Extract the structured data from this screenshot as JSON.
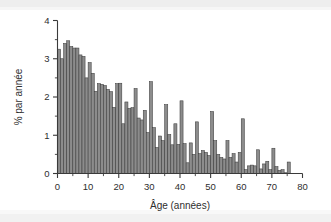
{
  "chart_data": {
    "type": "bar",
    "title": "",
    "subtitle": "",
    "xlabel": "Âge (années)",
    "ylabel": "% par année",
    "xlim": [
      0,
      80
    ],
    "ylim": [
      0,
      4
    ],
    "grid": false,
    "legend": null,
    "bin_width": 1,
    "x_ticks_major": [
      0,
      10,
      20,
      30,
      40,
      50,
      60,
      70,
      80
    ],
    "x_ticks_major_labels": [
      "0",
      "10",
      "20",
      "30",
      "40",
      "50",
      "60",
      "70",
      "80"
    ],
    "x_ticks_minor": [
      5,
      15,
      25,
      35,
      45,
      55,
      65,
      75
    ],
    "y_ticks_major": [
      0,
      1,
      2,
      3,
      4
    ],
    "y_ticks_major_labels": [
      "0",
      "1",
      "2",
      "3",
      "4"
    ],
    "y_ticks_minor": [
      0.5,
      1.5,
      2.5,
      3.5
    ],
    "categories": [
      0,
      1,
      2,
      3,
      4,
      5,
      6,
      7,
      8,
      9,
      10,
      11,
      12,
      13,
      14,
      15,
      16,
      17,
      18,
      19,
      20,
      21,
      22,
      23,
      24,
      25,
      26,
      27,
      28,
      29,
      30,
      31,
      32,
      33,
      34,
      35,
      36,
      37,
      38,
      39,
      40,
      41,
      42,
      43,
      44,
      45,
      46,
      47,
      48,
      49,
      50,
      51,
      52,
      53,
      54,
      55,
      56,
      57,
      58,
      59,
      60,
      61,
      62,
      63,
      64,
      65,
      66,
      67,
      68,
      69,
      70,
      71,
      72,
      73,
      74,
      75
    ],
    "values": [
      3.25,
      3.0,
      3.4,
      3.47,
      3.32,
      3.28,
      3.28,
      3.1,
      3.06,
      2.5,
      2.9,
      2.62,
      2.15,
      2.35,
      2.33,
      2.3,
      2.2,
      2.14,
      1.73,
      2.35,
      2.36,
      1.3,
      1.87,
      1.7,
      1.72,
      2.22,
      1.45,
      1.4,
      1.65,
      1.07,
      2.4,
      1.2,
      0.68,
      0.98,
      0.86,
      1.8,
      1.02,
      0.75,
      1.3,
      0.76,
      1.9,
      0.78,
      0.28,
      0.8,
      0.5,
      1.35,
      0.52,
      0.6,
      0.55,
      0.47,
      1.62,
      0.86,
      0.5,
      0.42,
      0.38,
      0.86,
      0.42,
      0.52,
      0.3,
      0.55,
      1.43,
      0.1,
      0.2,
      0.22,
      0.2,
      0.62,
      0.12,
      0.25,
      0.32,
      0.1,
      0.66,
      0.18,
      0.08,
      0.1,
      0.02,
      0.3
    ]
  },
  "axes": {
    "y_axis_title": "% par année",
    "x_axis_title": "Âge (années)"
  }
}
